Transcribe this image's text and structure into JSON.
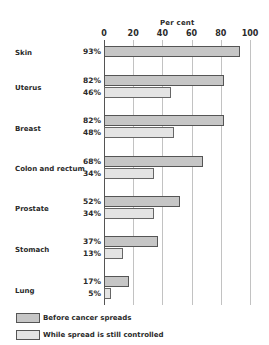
{
  "chart_data": {
    "type": "bar",
    "orientation": "horizontal",
    "title": "",
    "xlabel": "Per cent",
    "ylabel": "",
    "xlim": [
      0,
      100
    ],
    "x_ticks": [
      "0",
      "20",
      "40",
      "60",
      "80",
      "100"
    ],
    "grid": true,
    "legend_position": "bottom-left",
    "categories": [
      "Skin",
      "Uterus",
      "Breast",
      "Colon and rectum",
      "Prostate",
      "Stomach",
      "Lung"
    ],
    "series": [
      {
        "name": "Before cancer spreads",
        "color": "#c6c6c6",
        "values": [
          93,
          82,
          82,
          68,
          52,
          37,
          17
        ]
      },
      {
        "name": "While spread is still controlled",
        "color": "#e4e4e4",
        "values": [
          null,
          46,
          48,
          34,
          34,
          13,
          5
        ]
      }
    ],
    "value_labels": {
      "before": [
        "93%",
        "82%",
        "82%",
        "68%",
        "52%",
        "37%",
        "17%"
      ],
      "while": [
        "",
        "46%",
        "48%",
        "34%",
        "34%",
        "13%",
        "5%"
      ]
    }
  },
  "axis": {
    "title": "Per cent",
    "ticks": [
      "0",
      "20",
      "40",
      "60",
      "80",
      "100"
    ]
  },
  "legend": {
    "before": "Before cancer spreads",
    "while": "While spread is still controlled"
  }
}
